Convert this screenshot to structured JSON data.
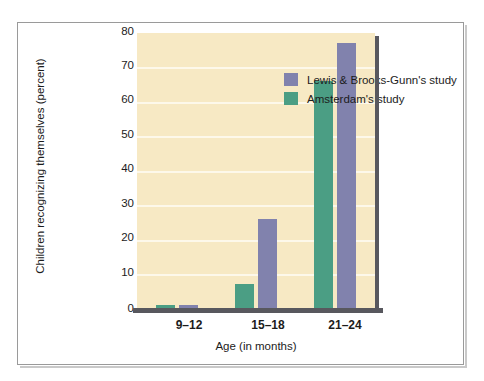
{
  "chart_data": {
    "type": "bar",
    "title": "",
    "subtitle": "",
    "xlabel": "Age (in months)",
    "ylabel": "Children recognizing themselves (percent)",
    "categories": [
      "9–12",
      "15–18",
      "21–24"
    ],
    "ylim": [
      0,
      80
    ],
    "yticks": [
      "0",
      "10",
      "20",
      "30",
      "40",
      "50",
      "60",
      "70",
      "80"
    ],
    "grid": "horizontal",
    "legend_position": "inside-top-left",
    "series": [
      {
        "name": "Amsterdam's study",
        "color": "#4b9e84",
        "values": [
          1,
          7,
          66
        ]
      },
      {
        "name": "Lewis & Brooks-Gunn's study",
        "color": "#8182ad",
        "values": [
          1,
          26,
          77
        ]
      }
    ],
    "colors": {
      "plot_background": "#f7e9c4",
      "gridline": "#fdf8ea",
      "axis": "#58585e",
      "page_background": "#ffffff",
      "frame": "#9a9a9a"
    }
  },
  "legend": {
    "items": [
      {
        "label": "Lewis & Brooks-Gunn's study",
        "color": "#8182ad"
      },
      {
        "label": "Amsterdam's study",
        "color": "#4b9e84"
      }
    ]
  },
  "axes": {
    "y": {
      "title": "Children recognizing themselves (percent)",
      "ticks": [
        "80",
        "70",
        "60",
        "50",
        "40",
        "30",
        "20",
        "10",
        "0"
      ]
    },
    "x": {
      "title": "Age (in months)",
      "ticks": [
        "9–12",
        "15–18",
        "21–24"
      ]
    }
  }
}
